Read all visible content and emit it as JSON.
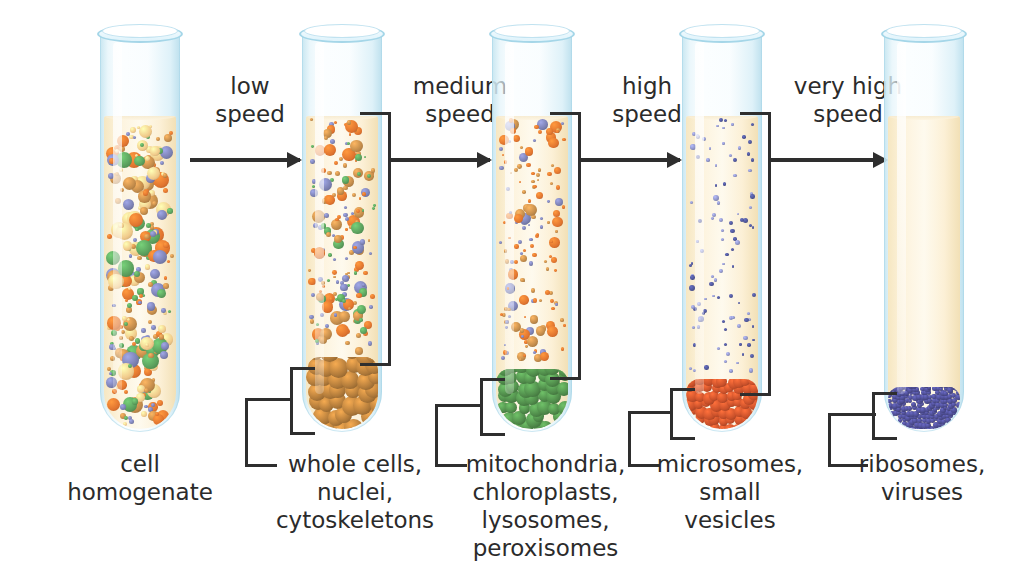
{
  "credit": "J. Marini/Shutterstock.com",
  "diagram": {
    "background_color": "#ffffff",
    "arrow_color": "#2e2e2e",
    "tube_glass_color": "#bddff0",
    "liquid_color": "#fdf3dd"
  },
  "steps": [
    {
      "id": "step-low",
      "speed_label": "low\nspeed",
      "arrow": true
    },
    {
      "id": "step-medium",
      "speed_label": "medium\nspeed",
      "arrow": true
    },
    {
      "id": "step-high",
      "speed_label": "high\nspeed",
      "arrow": true
    },
    {
      "id": "step-very-high",
      "speed_label": "very high\nspeed",
      "arrow": true
    }
  ],
  "tubes": [
    {
      "id": "tube-1",
      "caption": "cell\nhomogenate",
      "has_pellet": false,
      "suspension": "mixed organelles",
      "particle_colors": [
        "#5a9e5c",
        "#e0742f",
        "#c08a4a",
        "#7a7fb0",
        "#f0c98a"
      ]
    },
    {
      "id": "tube-2",
      "caption": "whole cells,\nnuclei,\ncytoskeletons",
      "has_pellet": true,
      "pellet_color": "#b07a3a",
      "suspension": "smaller organelles",
      "particle_colors": [
        "#5a9e5c",
        "#e0742f",
        "#c08a4a",
        "#7a7fb0"
      ]
    },
    {
      "id": "tube-3",
      "caption": "mitochondria,\nchloroplasts,\nlysosomes,\nperoxisomes",
      "has_pellet": true,
      "pellet_color": "#4f8a4a",
      "suspension": "microsomes and small vesicles",
      "particle_colors": [
        "#e0742f",
        "#7a7fb0",
        "#c08a4a"
      ]
    },
    {
      "id": "tube-4",
      "caption": "microsomes,\nsmall\nvesicles",
      "has_pellet": true,
      "pellet_color": "#c8502a",
      "suspension": "ribosomes and viruses",
      "particle_colors": [
        "#4d5494",
        "#8a8fc0"
      ]
    },
    {
      "id": "tube-5",
      "caption": "ribosomes,\nviruses",
      "has_pellet": true,
      "pellet_color": "#4a4a8c",
      "suspension": "clear supernatant",
      "particle_colors": []
    }
  ]
}
